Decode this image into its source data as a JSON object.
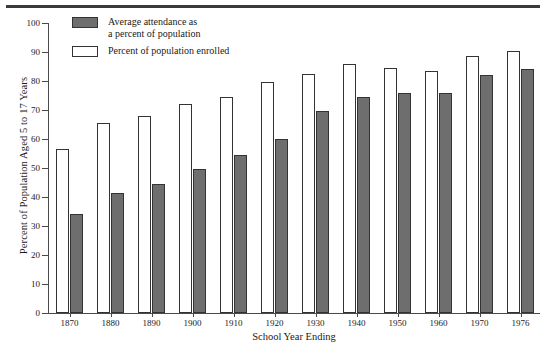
{
  "chart_data": {
    "type": "bar",
    "title": "",
    "xlabel": "School Year Ending",
    "ylabel": "Percent of Population Aged 5 to 17 Years",
    "categories": [
      "1870",
      "1880",
      "1890",
      "1900",
      "1910",
      "1920",
      "1930",
      "1940",
      "1950",
      "1960",
      "1970",
      "1976"
    ],
    "ylim": [
      0,
      100
    ],
    "yticks": [
      0,
      10,
      20,
      30,
      40,
      50,
      60,
      70,
      80,
      90,
      100
    ],
    "grid": false,
    "legend_position": "top-left inside plot",
    "series": [
      {
        "name": "Percent of population enrolled",
        "key": "enrolled",
        "color": "#ffffff",
        "values": [
          56.5,
          65.5,
          68.0,
          72.0,
          74.5,
          79.5,
          82.5,
          86.0,
          84.5,
          83.5,
          88.5,
          90.5
        ]
      },
      {
        "name": "Average attendance as a percent of population",
        "key": "attendance",
        "color": "#6e6e6e",
        "values": [
          34.0,
          41.5,
          44.5,
          49.7,
          54.5,
          60.0,
          69.5,
          74.5,
          76.0,
          76.0,
          82.0,
          84.0
        ]
      }
    ]
  },
  "legend": {
    "items": [
      {
        "label": "Average attendance as\na percent of population",
        "swatch": "attendance"
      },
      {
        "label": "Percent of population enrolled",
        "swatch": "enrolled"
      }
    ]
  },
  "axes": {
    "y_title": "Percent of Population Aged 5 to 17 Years",
    "x_title": "School Year Ending"
  },
  "colors": {
    "attendance_fill": "#6e6e6e",
    "enrolled_fill": "#ffffff",
    "bar_outline": "#333333",
    "axis": "#4a4a4a",
    "top_rule": "#3a3a3a",
    "text": "#1a1a1a"
  }
}
